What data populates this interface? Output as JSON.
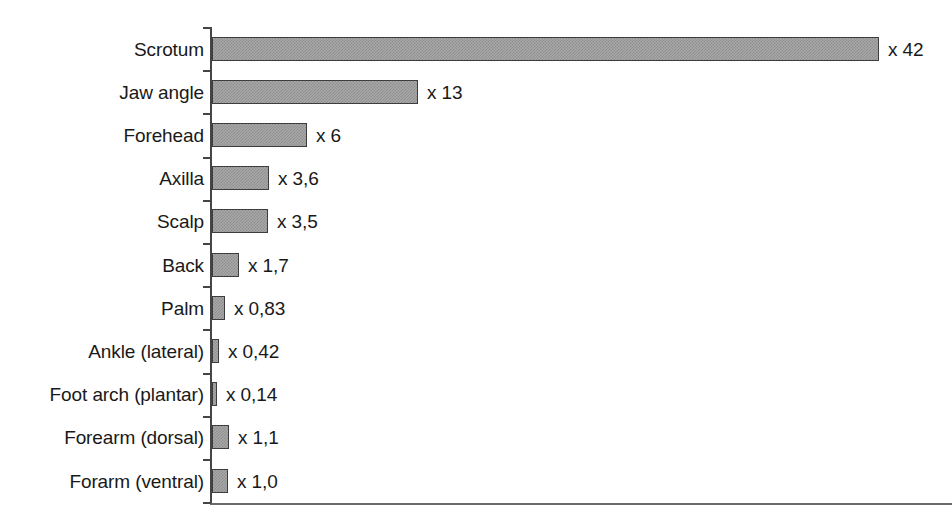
{
  "chart_data": {
    "type": "bar",
    "orientation": "horizontal",
    "title": "",
    "subtitle": "",
    "xlabel": "",
    "ylabel": "",
    "xlim": [
      0,
      46.6
    ],
    "grid": false,
    "legend": null,
    "value_prefix": "x",
    "decimal_separator": ",",
    "categories": [
      "Scrotum",
      "Jaw angle",
      "Forehead",
      "Axilla",
      "Scalp",
      "Back",
      "Palm",
      "Ankle (lateral)",
      "Foot arch (plantar)",
      "Forearm (dorsal)",
      "Forarm (ventral)"
    ],
    "values": [
      42,
      13,
      6,
      3.6,
      3.5,
      1.7,
      0.83,
      0.42,
      0.14,
      1.1,
      1.0
    ],
    "value_labels": [
      "x  42",
      "x 13",
      "x 6",
      "x 3,6",
      "x 3,5",
      "x 1,7",
      "x 0,83",
      "x 0,42",
      "x 0,14",
      "x 1,1",
      "x 1,0"
    ],
    "series": [
      {
        "name": "Relative permeability",
        "values": [
          42,
          13,
          6,
          3.6,
          3.5,
          1.7,
          0.83,
          0.42,
          0.14,
          1.1,
          1.0
        ]
      }
    ]
  },
  "style": {
    "background": "#ffffff",
    "bar_fill": "#a8a8a8",
    "bar_pattern": "#8d8d8d",
    "bar_border": "#3d3d3d",
    "axis_color": "#454545",
    "baseline_color": "#6a6a6a",
    "text_color": "#191919"
  },
  "geometry": {
    "axis_x": 211,
    "axis_top": 27,
    "axis_bottom": 503,
    "px_per_unit": 15.88,
    "row_pitch": 43.2,
    "bar_height": 24,
    "label_right_edge": 204,
    "value_gap": 9
  }
}
